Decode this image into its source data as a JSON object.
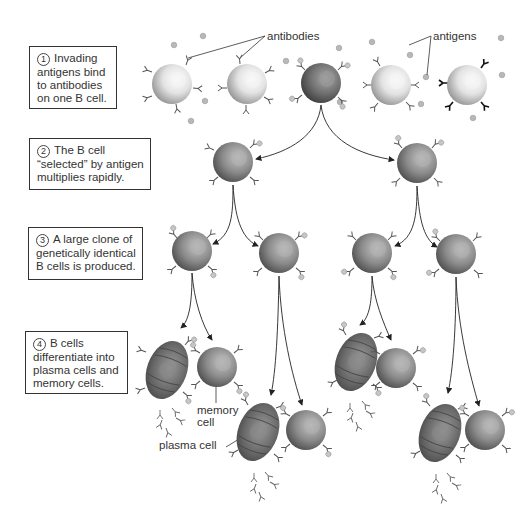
{
  "steps": [
    {
      "number": "1",
      "text_lines": [
        "Invading",
        "antigens bind",
        "to antibodies",
        "on one B cell."
      ]
    },
    {
      "number": "2",
      "text_lines": [
        "The B cell",
        "“selected” by antigen",
        "multiplies rapidly."
      ]
    },
    {
      "number": "3",
      "text_lines": [
        "A large clone of",
        "genetically identical",
        "B cells is produced."
      ]
    },
    {
      "number": "4",
      "text_lines": [
        "B cells",
        "differentiate into",
        "plasma cells and",
        "memory cells."
      ]
    }
  ],
  "labels": {
    "antibodies": "antibodies",
    "antigens": "antigens",
    "memory_cell_line1": "memory",
    "memory_cell_line2": "cell",
    "plasma_cell": "plasma cell"
  },
  "colors": {
    "naive_cell": "#d8d8d8",
    "selected_cell": "#6a6a6a",
    "clone_cell": "#7c7c7c",
    "plasma_cell": "#5e5e5e",
    "memory_cell": "#8a8a8a",
    "antigen": "#b5b5b5",
    "line": "#333333"
  }
}
